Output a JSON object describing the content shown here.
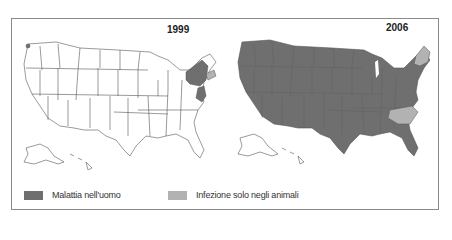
{
  "maps": [
    {
      "year": "1999",
      "affected_human": [
        "New York",
        "New Jersey",
        "Connecticut",
        "Maryland",
        "Delaware",
        "Washington (spot)"
      ],
      "affected_animal_only": [
        "Massachusetts",
        "Rhode Island",
        "Virginia"
      ],
      "rest_of_country": "unaffected"
    },
    {
      "year": "2006",
      "affected_human": "most states",
      "affected_animal_only": [
        "Maine",
        "Vermont",
        "New Hampshire",
        "North Carolina",
        "South Carolina (partial)"
      ],
      "unaffected": [
        "Alaska",
        "Hawaii"
      ]
    }
  ],
  "legend": [
    {
      "label": "Malattia nell'uomo",
      "color": "#6f6f6f"
    },
    {
      "label": "Infezione solo negli animali",
      "color": "#b2b2b2"
    }
  ],
  "colors": {
    "human": "#6f6f6f",
    "animal": "#b2b2b2",
    "none": "#ffffff",
    "outline": "#555555"
  }
}
